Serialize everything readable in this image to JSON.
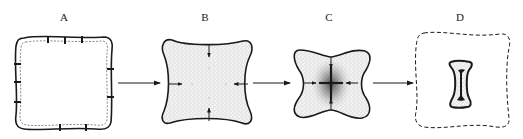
{
  "diagram": {
    "stages": [
      {
        "id": "A",
        "label": "A",
        "description": "rounded square with dotted inner boundary and radial marks"
      },
      {
        "id": "B",
        "label": "B",
        "description": "concave square with stippled fill and inward-pointing arrows"
      },
      {
        "id": "C",
        "label": "C",
        "description": "four-pointed star shape with dense central stippling and converging arrows"
      },
      {
        "id": "D",
        "label": "D",
        "description": "dashed outline with small bone-shaped remnant"
      }
    ],
    "transitions": [
      {
        "from": "A",
        "to": "B"
      },
      {
        "from": "B",
        "to": "C"
      },
      {
        "from": "C",
        "to": "D"
      }
    ],
    "colors": {
      "stroke": "#1a1a1a",
      "stipple": "#b8b8b8",
      "dense": "#555555",
      "background": "#ffffff"
    }
  }
}
